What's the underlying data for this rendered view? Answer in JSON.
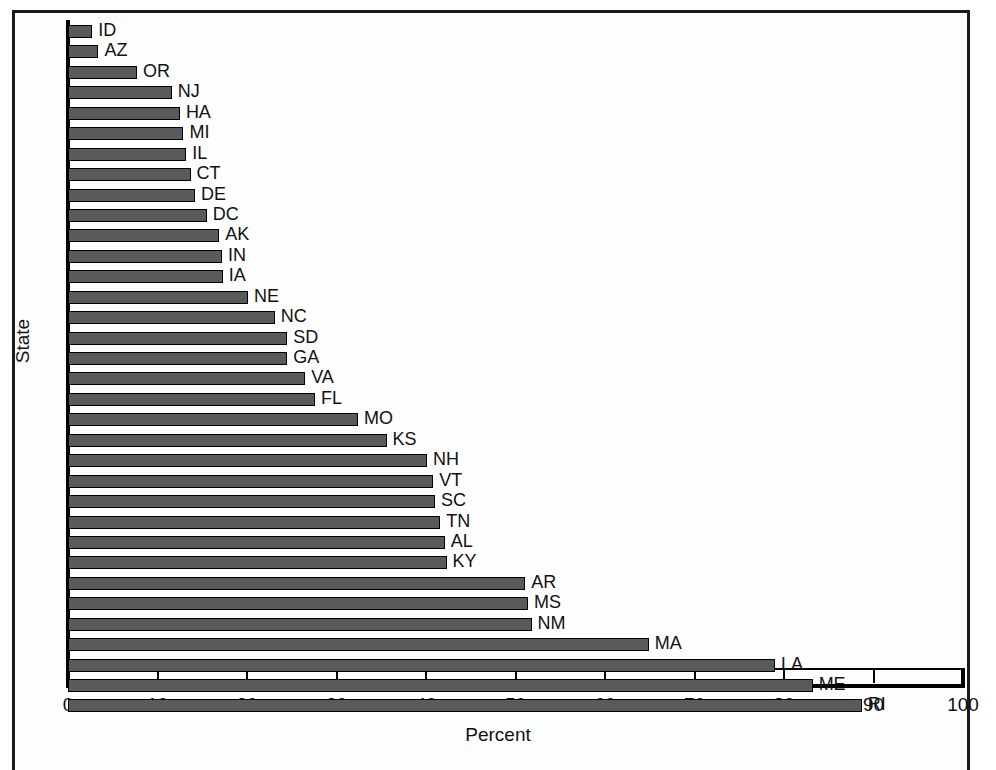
{
  "chart_data": {
    "type": "bar",
    "orientation": "horizontal",
    "title": "",
    "xlabel": "Percent",
    "ylabel": "State",
    "xlim": [
      0,
      100
    ],
    "xticks": [
      0,
      10,
      20,
      30,
      40,
      50,
      60,
      70,
      80,
      90,
      100
    ],
    "grid": false,
    "legend": null,
    "bar_color": "#5a5a5a",
    "bar_edge_color": "#000000",
    "categories": [
      "ID",
      "AZ",
      "OR",
      "NJ",
      "HA",
      "MI",
      "IL",
      "CT",
      "DE",
      "DC",
      "AK",
      "IN",
      "IA",
      "NE",
      "NC",
      "SD",
      "GA",
      "VA",
      "FL",
      "MO",
      "KS",
      "NH",
      "VT",
      "SC",
      "TN",
      "AL",
      "KY",
      "AR",
      "MS",
      "NM",
      "MA",
      "LA",
      "ME",
      "RI"
    ],
    "values": [
      2.7,
      3.4,
      7.7,
      11.6,
      12.5,
      12.9,
      13.2,
      13.7,
      14.2,
      15.5,
      16.9,
      17.2,
      17.3,
      20.1,
      23.1,
      24.5,
      24.5,
      26.5,
      27.6,
      32.4,
      35.6,
      40.1,
      40.8,
      41.0,
      41.6,
      42.1,
      42.3,
      51.1,
      51.4,
      51.8,
      64.9,
      79.0,
      83.2,
      88.7
    ]
  }
}
